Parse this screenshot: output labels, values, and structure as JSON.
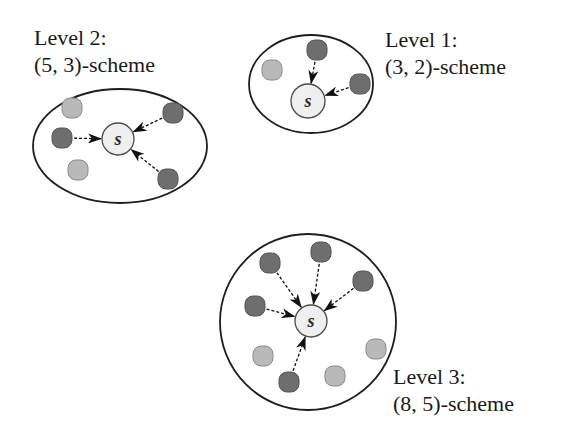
{
  "colors": {
    "background": "#ffffff",
    "boundary": "#1e1e1e",
    "server_fill": "#efefef",
    "server_stroke": "#4a4a4a",
    "active_node": "#6e6e6e",
    "active_node_stroke": "#555555",
    "idle_node": "#b9b9b9",
    "idle_node_stroke": "#8a8a8a",
    "arrow": "#111111"
  },
  "groups": [
    {
      "id": "level-2",
      "title": "Level 2:",
      "scheme": "(5, 3)-scheme",
      "label_pos": {
        "x": 34,
        "y1": 45,
        "y2": 72
      },
      "boundary": {
        "shape": "ellipse",
        "cx": 120,
        "cy": 146,
        "rx": 87,
        "ry": 57
      },
      "server": {
        "label": "s",
        "cx": 118,
        "cy": 139,
        "r": 16
      },
      "active_nodes": [
        {
          "x": 62,
          "y": 138
        },
        {
          "x": 173,
          "y": 113
        },
        {
          "x": 168,
          "y": 179
        }
      ],
      "idle_nodes": [
        {
          "x": 72,
          "y": 108
        },
        {
          "x": 78,
          "y": 170
        }
      ]
    },
    {
      "id": "level-1",
      "title": "Level 1:",
      "scheme": "(3, 2)-scheme",
      "label_pos": {
        "x": 385,
        "y1": 47,
        "y2": 74
      },
      "boundary": {
        "shape": "ellipse",
        "cx": 311,
        "cy": 84,
        "rx": 62,
        "ry": 49
      },
      "server": {
        "label": "s",
        "cx": 308,
        "cy": 101,
        "r": 17
      },
      "active_nodes": [
        {
          "x": 317,
          "y": 50
        },
        {
          "x": 360,
          "y": 84
        }
      ],
      "idle_nodes": [
        {
          "x": 272,
          "y": 70
        }
      ]
    },
    {
      "id": "level-3",
      "title": "Level 3:",
      "scheme": "(8, 5)-scheme",
      "label_pos": {
        "x": 393,
        "y1": 384,
        "y2": 411
      },
      "boundary": {
        "shape": "ellipse",
        "cx": 308,
        "cy": 322,
        "rx": 88,
        "ry": 88
      },
      "server": {
        "label": "s",
        "cx": 311,
        "cy": 321,
        "r": 16
      },
      "active_nodes": [
        {
          "x": 270,
          "y": 263
        },
        {
          "x": 321,
          "y": 252
        },
        {
          "x": 363,
          "y": 281
        },
        {
          "x": 255,
          "y": 306
        },
        {
          "x": 289,
          "y": 382
        }
      ],
      "idle_nodes": [
        {
          "x": 263,
          "y": 356
        },
        {
          "x": 335,
          "y": 376
        },
        {
          "x": 376,
          "y": 349
        }
      ]
    }
  ]
}
